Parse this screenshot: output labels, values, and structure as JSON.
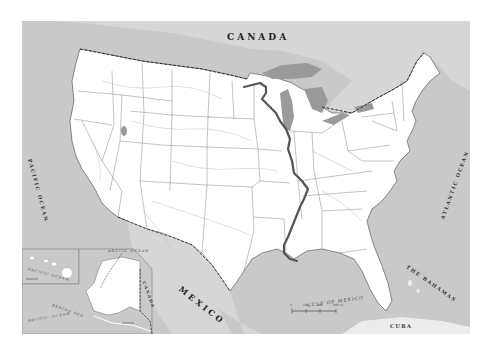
{
  "map": {
    "title": "United States with Mississippi River route",
    "colors": {
      "water": "#c9c9c9",
      "land_us": "#ffffff",
      "land_foreign": "#d6d6d6",
      "great_lakes": "#9a9a9a",
      "river_route": "#555555",
      "border": "#333333",
      "state_lines": "#777777",
      "rivers": "#bbbbbb"
    },
    "labels": {
      "canada": "CANADA",
      "mexico": "MEXICO",
      "pacific_ocean": "PACIFIC OCEAN",
      "atlantic_ocean": "ATLANTIC OCEAN",
      "gulf_of_mexico": "GULF OF MEXICO",
      "the_bahamas": "THE BAHAMAS",
      "cuba": "CUBA",
      "alaska_canada": "CANADA",
      "arctic_ocean": "ARCTIC OCEAN",
      "bering_sea": "BERING SEA",
      "pacific_inset": "PACIFIC OCEAN",
      "hawaii_pacific": "PACIFIC OCEAN"
    },
    "highlighted_route": {
      "name": "Mississippi River",
      "from": "Minnesota headwaters",
      "to": "Gulf of Mexico (New Orleans)"
    },
    "scale_bar": {
      "miles": [
        "0",
        "100",
        "200",
        "300 mi"
      ],
      "km": [
        "0",
        "100",
        "200",
        "300 km"
      ]
    },
    "insets": [
      {
        "name": "Alaska",
        "scale": [
          "0",
          "300 mi"
        ]
      },
      {
        "name": "Hawaii",
        "scale": [
          "0",
          "100 mi"
        ]
      }
    ]
  }
}
